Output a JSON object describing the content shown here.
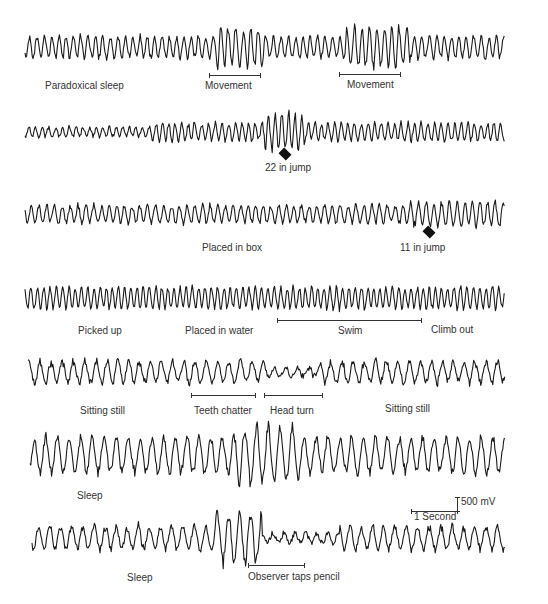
{
  "chart_data": {
    "type": "line",
    "title": "",
    "xlabel": "Time",
    "ylabel": "Voltage",
    "grid": false,
    "scale": {
      "voltage": "500 mV",
      "time": "1 Second"
    },
    "series": [
      {
        "name": "trace-1",
        "annotations": [
          {
            "text": "Paradoxical sleep",
            "type": "label"
          },
          {
            "text": "Movement",
            "type": "bar"
          },
          {
            "text": "Movement",
            "type": "bar"
          }
        ],
        "character": "regular high-frequency oscillation, amplitude bursts during movement"
      },
      {
        "name": "trace-2",
        "annotations": [
          {
            "text": "22 in jump",
            "type": "arrow"
          }
        ],
        "character": "low amplitude, increasing to large burst at jump"
      },
      {
        "name": "trace-3",
        "annotations": [
          {
            "text": "Placed in box",
            "type": "label"
          },
          {
            "text": "11 in jump",
            "type": "arrow"
          }
        ],
        "character": "moderate regular oscillation"
      },
      {
        "name": "trace-4",
        "annotations": [
          {
            "text": "Picked up",
            "type": "label"
          },
          {
            "text": "Placed in water",
            "type": "label"
          },
          {
            "text": "Swim",
            "type": "bar"
          },
          {
            "text": "Climb out",
            "type": "label"
          }
        ],
        "character": "dense regular oscillation throughout"
      },
      {
        "name": "trace-5",
        "annotations": [
          {
            "text": "Sitting still",
            "type": "label"
          },
          {
            "text": "Teeth chatter",
            "type": "bar"
          },
          {
            "text": "Head turn",
            "type": "bar"
          },
          {
            "text": "Sitting still",
            "type": "label"
          }
        ],
        "character": "irregular lower amplitude activity"
      },
      {
        "name": "trace-6",
        "annotations": [
          {
            "text": "Sleep",
            "type": "label"
          }
        ],
        "character": "large irregular slow waves with spindle bursts"
      },
      {
        "name": "trace-7",
        "annotations": [
          {
            "text": "Sleep",
            "type": "label"
          },
          {
            "text": "Observer taps pencil",
            "type": "bar"
          }
        ],
        "character": "irregular, burst then flattening after pencil tap"
      }
    ]
  },
  "labels": {
    "t1_paradoxical": "Paradoxical sleep",
    "t1_movement1": "Movement",
    "t1_movement2": "Movement",
    "t2_jump": "22 in jump",
    "t3_box": "Placed in box",
    "t3_jump": "11 in jump",
    "t4_picked": "Picked up",
    "t4_water": "Placed in water",
    "t4_swim": "Swim",
    "t4_climb": "Climb out",
    "t5_still1": "Sitting still",
    "t5_teeth": "Teeth chatter",
    "t5_head": "Head turn",
    "t5_still2": "Sitting still",
    "t6_sleep": "Sleep",
    "t7_sleep": "Sleep",
    "t7_pencil": "Observer taps pencil",
    "scale_voltage": "500 mV",
    "scale_time": "1 Second"
  },
  "colors": {
    "trace": "#1a1a1a",
    "text": "#333333",
    "background": "#ffffff"
  }
}
